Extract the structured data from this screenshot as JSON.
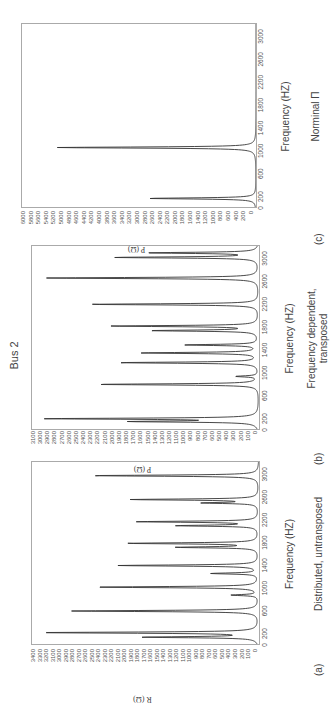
{
  "figure": {
    "title": "Bus 2",
    "panels": [
      {
        "letter": "(a)",
        "caption": "Distributed, untransposed",
        "xlabel": "Frequency (HZ)",
        "ylabel": "R (Ω)"
      },
      {
        "letter": "(b)",
        "caption": "Frequency dependent,\ntransposed",
        "xlabel": "Frequency (HZ)",
        "ylabel": "P (Ω)"
      },
      {
        "letter": "(c)",
        "caption": "Norminal Π",
        "xlabel": "Frequency (HZ)",
        "ylabel": "P (Ω)"
      }
    ]
  },
  "chart_data": [
    {
      "type": "line",
      "title": "(a) Distributed, untransposed",
      "xlabel": "Frequency (HZ)",
      "ylabel": "R (Ω)",
      "xlim": [
        0,
        3200
      ],
      "ylim": [
        0,
        3400
      ],
      "xticks": [
        0,
        200,
        600,
        1000,
        1400,
        1800,
        2200,
        2600,
        3000
      ],
      "yticks": [
        0,
        100,
        200,
        300,
        400,
        500,
        600,
        700,
        800,
        900,
        1000,
        1100,
        1200,
        1300,
        1400,
        1500,
        1600,
        1700,
        1800,
        1900,
        2000,
        2100,
        2200,
        2300,
        2400,
        2500,
        2600,
        2700,
        2800,
        2900,
        3000,
        3100,
        3200,
        3300,
        3400
      ],
      "peaks": [
        {
          "f": 120,
          "r": 1700
        },
        {
          "f": 200,
          "r": 3250
        },
        {
          "f": 580,
          "r": 2800
        },
        {
          "f": 860,
          "r": 400
        },
        {
          "f": 1000,
          "r": 2450
        },
        {
          "f": 1240,
          "r": 700
        },
        {
          "f": 1380,
          "r": 2100
        },
        {
          "f": 1700,
          "r": 1200
        },
        {
          "f": 1770,
          "r": 1950
        },
        {
          "f": 2080,
          "r": 1200
        },
        {
          "f": 2150,
          "r": 1800
        },
        {
          "f": 2480,
          "r": 800
        },
        {
          "f": 2540,
          "r": 1900
        },
        {
          "f": 2960,
          "r": 2500
        }
      ]
    },
    {
      "type": "line",
      "title": "(b) Frequency dependent, transposed",
      "xlabel": "Frequency (HZ)",
      "ylabel": "P (Ω)",
      "xlim": [
        0,
        3200
      ],
      "ylim": [
        0,
        3100
      ],
      "xticks": [
        0,
        200,
        600,
        1000,
        1400,
        1800,
        2200,
        2600,
        3000
      ],
      "yticks": [
        0,
        100,
        200,
        300,
        400,
        500,
        600,
        700,
        800,
        900,
        1000,
        1100,
        1200,
        1300,
        1400,
        1500,
        1600,
        1700,
        1800,
        1900,
        2000,
        2100,
        2200,
        2300,
        2400,
        2500,
        2600,
        2700,
        2800,
        2900,
        3000,
        3100
      ],
      "peaks": [
        {
          "f": 130,
          "r": 1650
        },
        {
          "f": 180,
          "r": 2850
        },
        {
          "f": 780,
          "r": 2200
        },
        {
          "f": 920,
          "r": 300
        },
        {
          "f": 1160,
          "r": 1900
        },
        {
          "f": 1330,
          "r": 1600
        },
        {
          "f": 1470,
          "r": 1000
        },
        {
          "f": 1720,
          "r": 1450
        },
        {
          "f": 1800,
          "r": 2000
        },
        {
          "f": 2180,
          "r": 2300
        },
        {
          "f": 2640,
          "r": 2900
        },
        {
          "f": 3000,
          "r": 1950
        },
        {
          "f": 3080,
          "r": 1500
        }
      ]
    },
    {
      "type": "line",
      "title": "(c) Norminal Π",
      "xlabel": "Frequency (HZ)",
      "ylabel": "P (Ω)",
      "xlim": [
        0,
        3200
      ],
      "ylim": [
        0,
        6000
      ],
      "xticks": [
        0,
        200,
        600,
        1000,
        1400,
        1800,
        2200,
        2600,
        3000
      ],
      "yticks": [
        0,
        200,
        400,
        600,
        800,
        1000,
        1200,
        1400,
        1600,
        1800,
        2000,
        2200,
        2400,
        2600,
        2800,
        3000,
        3200,
        3400,
        3600,
        3800,
        4000,
        4200,
        4400,
        4600,
        4800,
        5000,
        5200,
        5400,
        5600,
        5800,
        6000
      ],
      "peaks": [
        {
          "f": 150,
          "r": 2750
        },
        {
          "f": 1040,
          "r": 5100
        }
      ]
    }
  ]
}
